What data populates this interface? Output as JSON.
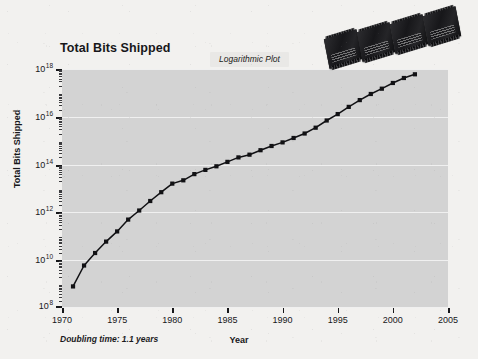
{
  "figure": {
    "title": "Total Bits Shipped",
    "annotation": "Logarithmic Plot",
    "note": "Doubling time: 1.1 years",
    "xlabel": "Year",
    "ylabel": "Total Bits Shipped",
    "background_color": "#f2f1ef",
    "plot_background_color": "#d3d3d3",
    "gridline_color": "#f0f0f0",
    "series_color": "#111114",
    "annotation_background_color": "#e9e8e6"
  },
  "chart_data": {
    "type": "line",
    "title": "Total Bits Shipped",
    "subtitle": "Logarithmic Plot",
    "xlabel": "Year",
    "ylabel": "Total Bits Shipped",
    "yscale": "log",
    "xlim": [
      1970,
      2005
    ],
    "ylim": [
      100000000.0,
      1e+18
    ],
    "grid": true,
    "legend": null,
    "annotations": [
      "Logarithmic Plot",
      "Doubling time: 1.1 years"
    ],
    "xticks": [
      1970,
      1975,
      1980,
      1985,
      1990,
      1995,
      2000,
      2005
    ],
    "xtick_labels": [
      "1970",
      "1975",
      "1980",
      "1985",
      "1990",
      "1995",
      "2000",
      "2005"
    ],
    "yticks": [
      100000000.0,
      10000000000.0,
      1000000000000.0,
      100000000000000.0,
      1e+16,
      1e+18
    ],
    "ytick_labels": [
      "10⁸",
      "10¹⁰",
      "10¹²",
      "10¹⁴",
      "10¹⁶",
      "10¹⁸"
    ],
    "ytick_bases": [
      "10",
      "10",
      "10",
      "10",
      "10",
      "10"
    ],
    "ytick_exponents": [
      "8",
      "10",
      "12",
      "14",
      "16",
      "18"
    ],
    "marker": "square",
    "series": [
      {
        "name": "Total Bits Shipped",
        "x": [
          1971,
          1972,
          1973,
          1974,
          1975,
          1976,
          1977,
          1978,
          1979,
          1980,
          1981,
          1982,
          1983,
          1984,
          1985,
          1986,
          1987,
          1988,
          1989,
          1990,
          1991,
          1992,
          1993,
          1994,
          1995,
          1996,
          1997,
          1998,
          1999,
          2000,
          2001,
          2002
        ],
        "y": [
          800000000.0,
          6000000000.0,
          20000000000.0,
          60000000000.0,
          160000000000.0,
          500000000000.0,
          1200000000000.0,
          3000000000000.0,
          7000000000000.0,
          16000000000000.0,
          22000000000000.0,
          40000000000000.0,
          60000000000000.0,
          85000000000000.0,
          130000000000000.0,
          200000000000000.0,
          260000000000000.0,
          400000000000000.0,
          600000000000000.0,
          850000000000000.0,
          1300000000000000.0,
          2000000000000000.0,
          3500000000000000.0,
          7000000000000000.0,
          1.3e+16,
          2.6e+16,
          5e+16,
          9e+16,
          1.5e+17,
          2.6e+17,
          4.2e+17,
          6e+17
        ]
      }
    ]
  },
  "images": {
    "chips_caption": "memory-chip-photos",
    "chip_count": 4
  }
}
